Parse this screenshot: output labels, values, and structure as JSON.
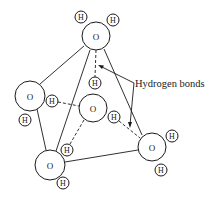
{
  "diagram": {
    "annotation": "Hydrogen bonds",
    "oxygen_label": "O",
    "hydrogen_label": "H",
    "molecules": [
      {
        "id": "top",
        "label": "O",
        "h1": "H",
        "h2": "H"
      },
      {
        "id": "left",
        "label": "O",
        "h1": "H",
        "h2": "H"
      },
      {
        "id": "center",
        "label": "O",
        "h1": "H",
        "h2": "H"
      },
      {
        "id": "right",
        "label": "O",
        "h1": "H",
        "h2": "H"
      },
      {
        "id": "bottom",
        "label": "O",
        "h1": "H",
        "h2": "H"
      }
    ]
  }
}
